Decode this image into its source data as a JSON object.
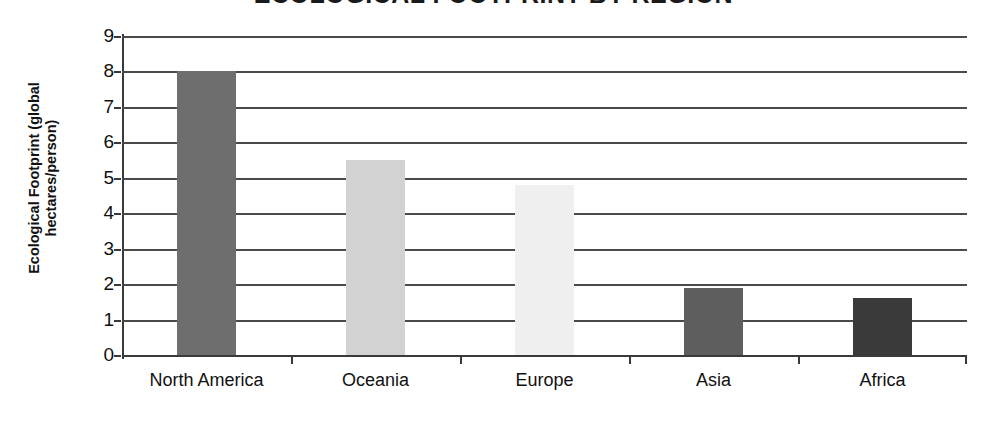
{
  "chart_data": {
    "type": "bar",
    "title": "ECOLOGICAL FOOTPRINT BY REGION",
    "xlabel": "",
    "ylabel": "Ecological Footprint (global hectares/person)",
    "ylabel_lines": [
      "Ecological Footprint (global",
      "hectares/person)"
    ],
    "categories": [
      "North America",
      "Oceania",
      "Europe",
      "Asia",
      "Africa"
    ],
    "values": [
      8.0,
      5.5,
      4.8,
      1.9,
      1.6
    ],
    "bar_colors": [
      "#6e6e6e",
      "#d2d2d2",
      "#f0f0f0",
      "#5e5e5e",
      "#3a3a3a"
    ],
    "ylim": [
      0,
      9
    ],
    "ytick_labels": [
      "0",
      "1",
      "2",
      "3",
      "4",
      "5",
      "6",
      "7",
      "8",
      "9"
    ],
    "ytick_values": [
      0,
      1,
      2,
      3,
      4,
      5,
      6,
      7,
      8,
      9
    ],
    "grid": true,
    "grid_axis": "y",
    "legend": false,
    "legend_position": "none"
  }
}
